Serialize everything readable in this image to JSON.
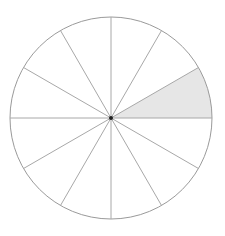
{
  "diagram": {
    "type": "fraction-circle",
    "total_sectors": 12,
    "shaded_sectors": [
      0
    ],
    "shaded_fraction": "1/12",
    "center": [
      111,
      118
    ],
    "radius": 101,
    "colors": {
      "background": "#ffffff",
      "outline": "#9a9a9a",
      "spokes": "#a8a8a8",
      "shade": "#e6e6e6",
      "center_dot": "#222222"
    }
  }
}
